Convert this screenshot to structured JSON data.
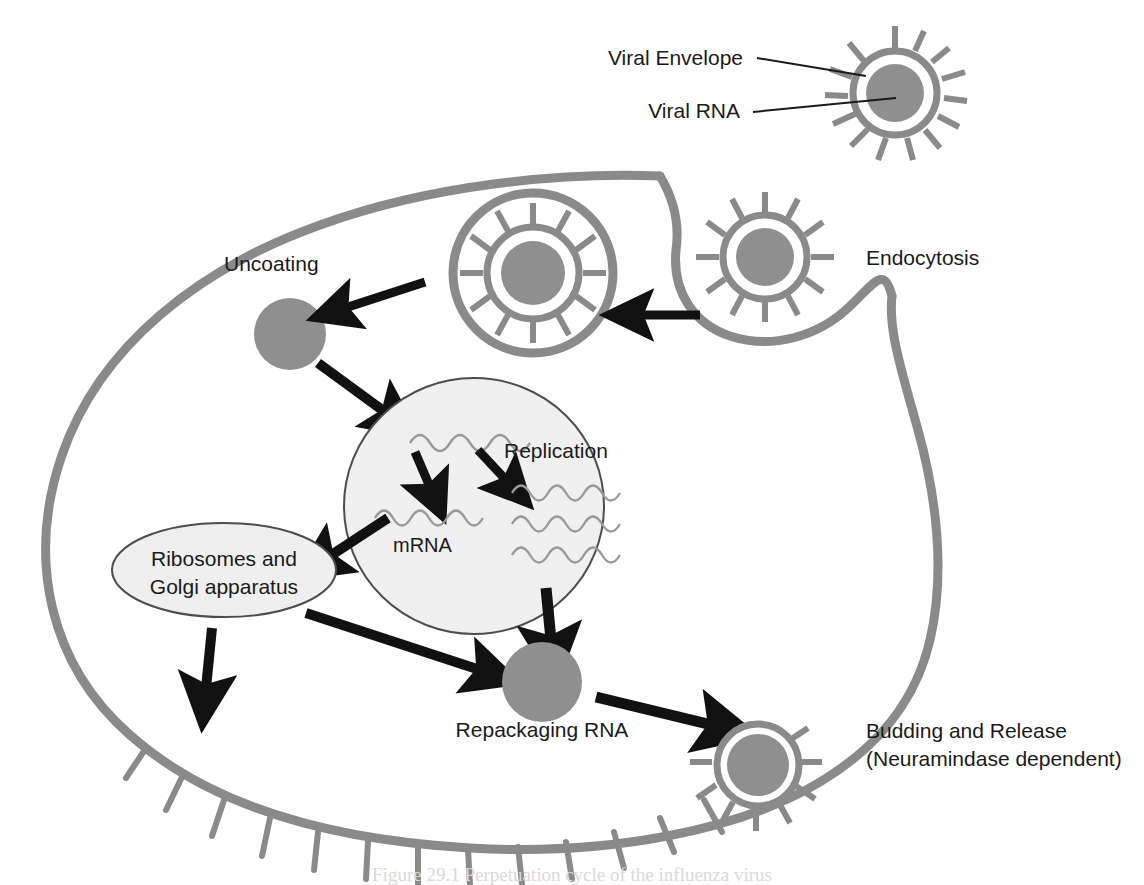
{
  "figure": {
    "caption": "Figure 29.1  Perpetuation cycle of the influenza virus",
    "background_color": "#ffffff"
  },
  "colors": {
    "membrane_gray": "#8a8a8a",
    "rna_core_gray": "#8f8f8f",
    "nucleus_fill": "#f0f0f0",
    "nucleus_stroke": "#4d4d4d",
    "organelle_fill": "#efefef",
    "organelle_stroke": "#4d4d4d",
    "arrow_black": "#111111",
    "leader_line": "#1a1a1a",
    "rna_strand": "#9a9a9a",
    "text_color": "#1a1a1a"
  },
  "labels": {
    "viral_envelope": "Viral Envelope",
    "viral_rna": "Viral RNA",
    "endocytosis": "Endocytosis",
    "uncoating": "Uncoating",
    "replication": "Replication",
    "mrna": "mRNA",
    "ribosomes_line1": "Ribosomes and",
    "ribosomes_line2": "Golgi apparatus",
    "repackaging_rna": "Repackaging RNA",
    "budding_line1": "Budding and Release",
    "budding_line2": "(Neuramindase dependent)"
  },
  "structures": {
    "free_virion": {
      "name": "free-virus-particle",
      "cx": 895,
      "cy": 93,
      "envelope_r": 45,
      "core_r": 29,
      "spikes": 14
    },
    "attached_virion": {
      "name": "virus-at-membrane",
      "cx": 765,
      "cy": 257,
      "envelope_r": 45,
      "core_r": 29,
      "spikes": 12
    },
    "endosome": {
      "name": "endosome-with-virus",
      "cx": 533,
      "cy": 273,
      "vesicle_r": 83,
      "envelope_r": 56,
      "core_r": 32,
      "spikes": 12
    },
    "uncoated_rna": {
      "name": "uncoated-rna-core",
      "cx": 290,
      "cy": 334,
      "r": 36
    },
    "nucleus": {
      "name": "nucleus",
      "cx": 474,
      "cy": 506,
      "rx": 130,
      "ry": 128
    },
    "organelle": {
      "name": "ribosomes-golgi-organelle",
      "cx": 224,
      "cy": 570,
      "rx": 112,
      "ry": 47
    },
    "repackaged_rna": {
      "name": "repackaged-rna-core",
      "cx": 542,
      "cy": 682,
      "r": 40
    },
    "budding_virion": {
      "name": "budding-virus-particle",
      "cx": 758,
      "cy": 765,
      "envelope_r": 44,
      "core_r": 31,
      "spikes": 9
    }
  },
  "rna_strands": {
    "nucleus_template": {
      "count": 1,
      "label": "template-rna-strand"
    },
    "mrna_strands": {
      "count": 1,
      "label": "mrna-strand"
    },
    "replicated_strands": {
      "count": 3,
      "label": "replicated-rna-strands"
    }
  },
  "arrows": [
    {
      "name": "arrow-endocytosis-to-endosome",
      "from": "virus-at-membrane",
      "to": "endosome"
    },
    {
      "name": "arrow-endosome-to-uncoating",
      "from": "endosome",
      "to": "uncoated-rna-core"
    },
    {
      "name": "arrow-uncoating-to-nucleus",
      "from": "uncoated-rna-core",
      "to": "nucleus"
    },
    {
      "name": "arrow-template-to-mrna",
      "from": "template-rna-strand",
      "to": "mrna-strand"
    },
    {
      "name": "arrow-template-to-replication",
      "from": "template-rna-strand",
      "to": "replicated-rna-strands"
    },
    {
      "name": "arrow-nucleus-to-organelle",
      "from": "nucleus",
      "to": "ribosomes-golgi-organelle"
    },
    {
      "name": "arrow-nucleus-to-repackaging",
      "from": "nucleus",
      "to": "repackaged-rna-core"
    },
    {
      "name": "arrow-organelle-to-repackaging",
      "from": "ribosomes-golgi-organelle",
      "to": "repackaged-rna-core"
    },
    {
      "name": "arrow-organelle-to-membrane",
      "from": "ribosomes-golgi-organelle",
      "to": "cell-membrane"
    },
    {
      "name": "arrow-repackaging-to-budding",
      "from": "repackaged-rna-core",
      "to": "budding-virus-particle"
    }
  ],
  "leader_lines": [
    {
      "name": "leader-viral-envelope",
      "label_ref": "viral_envelope"
    },
    {
      "name": "leader-viral-rna",
      "label_ref": "viral_rna"
    }
  ]
}
